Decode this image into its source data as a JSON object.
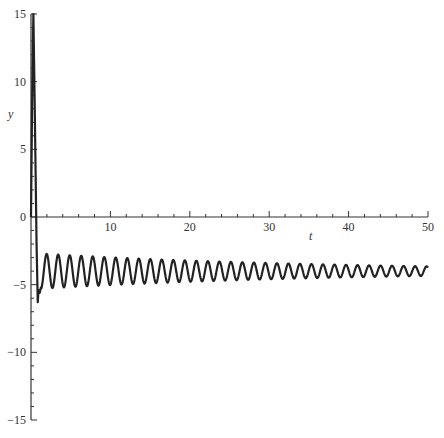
{
  "chart_data": {
    "type": "line",
    "title": "",
    "xlabel": "t",
    "ylabel": "y",
    "xlim": [
      0,
      50
    ],
    "ylim": [
      -15,
      15
    ],
    "grid": false,
    "legend": "none",
    "x_ticks": [
      "10",
      "20",
      "30",
      "40",
      "50"
    ],
    "y_ticks": [
      "15",
      "10",
      "5",
      "0",
      "-5",
      "-10",
      "-15"
    ],
    "series": [
      {
        "name": "y(t)",
        "description": "Initial spike to ~15 near t≈0.3, drop to ~-6.3 at t≈0.9, then damped oscillation about y≈-4.0 with period ≈1.45",
        "initial_spike": {
          "t": 0.3,
          "y": 15
        },
        "initial_min": {
          "t": 0.9,
          "y": -6.3
        },
        "oscillation_center": -4.0,
        "period": 1.45,
        "amplitude_start": 1.3,
        "amplitude_end": 0.35,
        "sample_points": [
          {
            "t": 0,
            "y": 0
          },
          {
            "t": 0.3,
            "y": 15
          },
          {
            "t": 0.8,
            "y": -6.3
          },
          {
            "t": 1.2,
            "y": -5.3
          },
          {
            "t": 1.8,
            "y": -2.8
          },
          {
            "t": 10,
            "y": -4.0
          },
          {
            "t": 20,
            "y": -4.0
          },
          {
            "t": 30,
            "y": -4.0
          },
          {
            "t": 40,
            "y": -4.0
          },
          {
            "t": 50,
            "y": -3.8
          }
        ]
      }
    ]
  },
  "labels": {
    "x_axis": "t",
    "y_axis": "y"
  }
}
